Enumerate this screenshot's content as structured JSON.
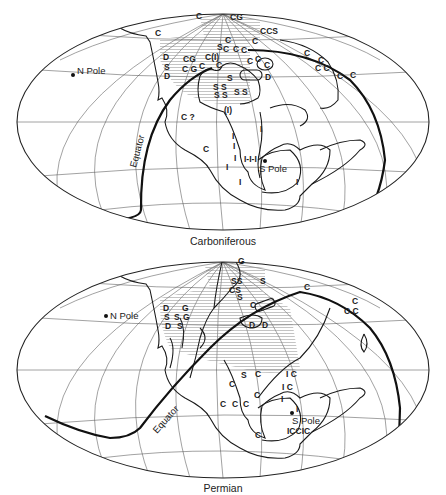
{
  "figure": {
    "panels": [
      {
        "caption": "Carboniferous",
        "labels": {
          "north_pole": "N Pole",
          "south_pole": "S Pole",
          "equator": "Equator"
        },
        "symbols": [
          {
            "text": "C",
            "x": 155,
            "y": 36
          },
          {
            "text": "D",
            "x": 163,
            "y": 60
          },
          {
            "text": "S",
            "x": 164,
            "y": 70
          },
          {
            "text": "D",
            "x": 164,
            "y": 79
          },
          {
            "text": "CG",
            "x": 183,
            "y": 62
          },
          {
            "text": "C G",
            "x": 182,
            "y": 72
          },
          {
            "text": "C",
            "x": 199,
            "y": 69
          },
          {
            "text": "C(I)",
            "x": 205,
            "y": 60
          },
          {
            "text": "C",
            "x": 216,
            "y": 68
          },
          {
            "text": "C",
            "x": 196,
            "y": 19
          },
          {
            "text": "CG",
            "x": 230,
            "y": 20
          },
          {
            "text": "S",
            "x": 217,
            "y": 50
          },
          {
            "text": "C",
            "x": 225,
            "y": 43
          },
          {
            "text": "C",
            "x": 223,
            "y": 52
          },
          {
            "text": "C",
            "x": 233,
            "y": 52
          },
          {
            "text": "C",
            "x": 241,
            "y": 53
          },
          {
            "text": "CCS",
            "x": 260,
            "y": 34
          },
          {
            "text": "C",
            "x": 252,
            "y": 44
          },
          {
            "text": "C",
            "x": 247,
            "y": 64
          },
          {
            "text": "C",
            "x": 255,
            "y": 62
          },
          {
            "text": "C",
            "x": 264,
            "y": 68
          },
          {
            "text": "D",
            "x": 265,
            "y": 80
          },
          {
            "text": "S",
            "x": 227,
            "y": 81
          },
          {
            "text": "S S",
            "x": 213,
            "y": 90
          },
          {
            "text": "S S",
            "x": 214,
            "y": 98
          },
          {
            "text": "S S",
            "x": 234,
            "y": 95
          },
          {
            "text": "(I)",
            "x": 224,
            "y": 113
          },
          {
            "text": "C ?",
            "x": 181,
            "y": 120
          },
          {
            "text": "C",
            "x": 304,
            "y": 56
          },
          {
            "text": "C",
            "x": 318,
            "y": 63
          },
          {
            "text": "C C",
            "x": 315,
            "y": 71
          },
          {
            "text": "C",
            "x": 337,
            "y": 79
          },
          {
            "text": "C",
            "x": 350,
            "y": 78
          },
          {
            "text": "I",
            "x": 260,
            "y": 132
          },
          {
            "text": "I",
            "x": 232,
            "y": 139
          },
          {
            "text": "I",
            "x": 233,
            "y": 149
          },
          {
            "text": "C",
            "x": 203,
            "y": 152
          },
          {
            "text": "I",
            "x": 234,
            "y": 161
          },
          {
            "text": "I-I-I",
            "x": 244,
            "y": 162
          },
          {
            "text": "I",
            "x": 226,
            "y": 170
          },
          {
            "text": "I",
            "x": 239,
            "y": 185
          },
          {
            "text": "I",
            "x": 296,
            "y": 185
          }
        ]
      },
      {
        "caption": "Permian",
        "labels": {
          "north_pole": "N Pole",
          "south_pole": "S Pole",
          "equator": "Equator"
        },
        "symbols": [
          {
            "text": "G",
            "x": 238,
            "y": 16
          },
          {
            "text": "D",
            "x": 163,
            "y": 63
          },
          {
            "text": "G",
            "x": 182,
            "y": 63
          },
          {
            "text": "S",
            "x": 164,
            "y": 72
          },
          {
            "text": "S",
            "x": 174,
            "y": 72
          },
          {
            "text": "G",
            "x": 183,
            "y": 72
          },
          {
            "text": "D",
            "x": 165,
            "y": 81
          },
          {
            "text": "S",
            "x": 177,
            "y": 81
          },
          {
            "text": "SS",
            "x": 231,
            "y": 36
          },
          {
            "text": "S",
            "x": 260,
            "y": 36
          },
          {
            "text": "CS",
            "x": 229,
            "y": 45
          },
          {
            "text": "S",
            "x": 237,
            "y": 52
          },
          {
            "text": "C",
            "x": 250,
            "y": 60
          },
          {
            "text": "D",
            "x": 249,
            "y": 80
          },
          {
            "text": "D",
            "x": 262,
            "y": 80
          },
          {
            "text": "C",
            "x": 304,
            "y": 42
          },
          {
            "text": "C",
            "x": 352,
            "y": 56
          },
          {
            "text": "C.C",
            "x": 344,
            "y": 66
          },
          {
            "text": "S",
            "x": 241,
            "y": 130
          },
          {
            "text": "C",
            "x": 255,
            "y": 129
          },
          {
            "text": "I C",
            "x": 286,
            "y": 129
          },
          {
            "text": "C",
            "x": 229,
            "y": 139
          },
          {
            "text": "I C",
            "x": 282,
            "y": 142
          },
          {
            "text": "C",
            "x": 254,
            "y": 150
          },
          {
            "text": "C",
            "x": 220,
            "y": 159
          },
          {
            "text": "C",
            "x": 232,
            "y": 159
          },
          {
            "text": "C",
            "x": 243,
            "y": 159
          },
          {
            "text": "I",
            "x": 281,
            "y": 154
          },
          {
            "text": "I",
            "x": 296,
            "y": 164
          },
          {
            "text": "S Pole",
            "x": 292,
            "y": 176
          },
          {
            "text": "ICCIC",
            "x": 287,
            "y": 186
          },
          {
            "text": "C",
            "x": 255,
            "y": 190
          }
        ]
      }
    ],
    "legend_codes": {
      "C": "coal",
      "S": "salt / evaporites",
      "G": "gypsum",
      "D": "desert sandstone",
      "I": "ice / glacial deposits",
      "(I)": "possible glacial deposits",
      "C ?": "possible coal"
    }
  }
}
